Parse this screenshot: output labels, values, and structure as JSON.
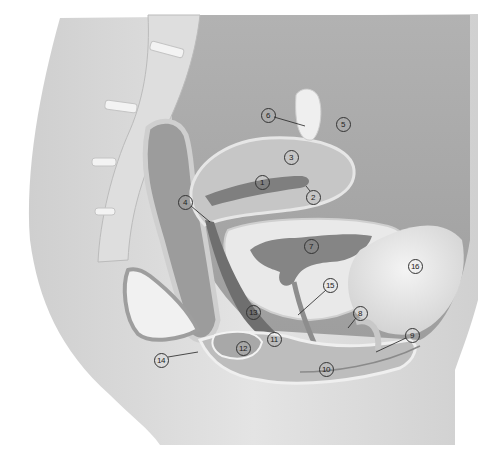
{
  "diagram": {
    "colors": {
      "background": "#ffffff",
      "skin": "#d9d9d9",
      "cavity": "#a8a8a8",
      "organ_light": "#c8c8c8",
      "organ_mid": "#9a9a9a",
      "organ_dark": "#6f6f6f",
      "bone": "#eeeeee",
      "leader_line": "#222222"
    },
    "callouts": [
      {
        "id": "1",
        "label": "1",
        "x": 262,
        "y": 182
      },
      {
        "id": "2",
        "label": "2",
        "x": 313,
        "y": 197
      },
      {
        "id": "3",
        "label": "3",
        "x": 291,
        "y": 157
      },
      {
        "id": "4",
        "label": "4",
        "x": 185,
        "y": 202
      },
      {
        "id": "5",
        "label": "5",
        "x": 343,
        "y": 124
      },
      {
        "id": "6",
        "label": "6",
        "x": 268,
        "y": 115
      },
      {
        "id": "7",
        "label": "7",
        "x": 311,
        "y": 246
      },
      {
        "id": "8",
        "label": "8",
        "x": 360,
        "y": 313
      },
      {
        "id": "9",
        "label": "9",
        "x": 412,
        "y": 335
      },
      {
        "id": "10",
        "label": "10",
        "x": 326,
        "y": 369
      },
      {
        "id": "11",
        "label": "11",
        "x": 274,
        "y": 339
      },
      {
        "id": "12",
        "label": "12",
        "x": 243,
        "y": 348
      },
      {
        "id": "13",
        "label": "13",
        "x": 253,
        "y": 312
      },
      {
        "id": "14",
        "label": "14",
        "x": 161,
        "y": 360
      },
      {
        "id": "15",
        "label": "15",
        "x": 330,
        "y": 285
      },
      {
        "id": "16",
        "label": "16",
        "x": 415,
        "y": 266
      }
    ]
  }
}
